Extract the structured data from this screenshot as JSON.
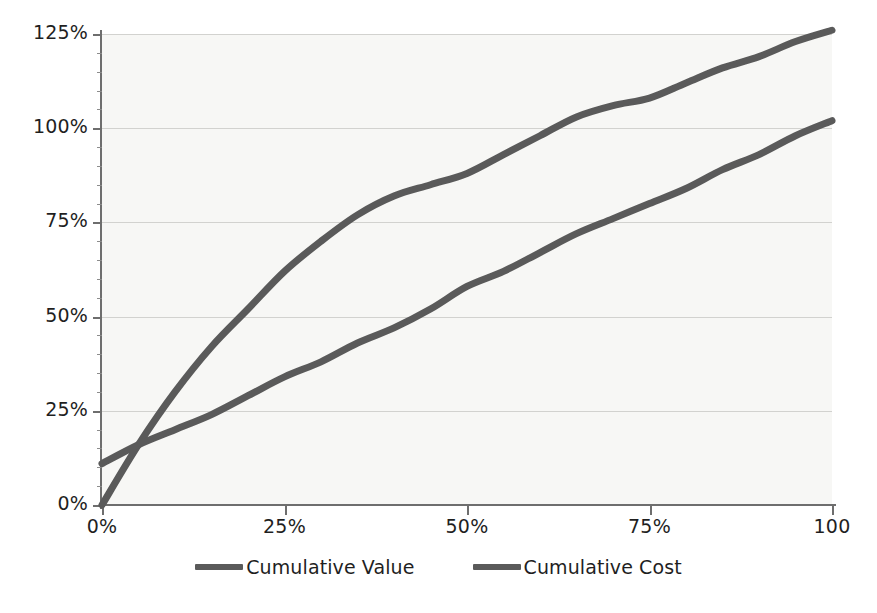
{
  "chart_data": {
    "type": "line",
    "title": "",
    "subtitle": "",
    "xlabel": "",
    "ylabel": "",
    "grid": true,
    "legend_position": "bottom",
    "xlim": [
      0,
      100
    ],
    "ylim": [
      0,
      125
    ],
    "x_tick_labels": [
      "0%",
      "25%",
      "50%",
      "75%",
      "100"
    ],
    "x_tick_values": [
      0,
      25,
      50,
      75,
      100
    ],
    "y_tick_labels": [
      "0%",
      "25%",
      "50%",
      "75%",
      "100%",
      "125%"
    ],
    "y_tick_values": [
      0,
      25,
      50,
      75,
      100,
      125
    ],
    "x": [
      0,
      5,
      10,
      15,
      20,
      25,
      30,
      35,
      40,
      45,
      50,
      55,
      60,
      65,
      70,
      75,
      80,
      85,
      90,
      95,
      100
    ],
    "series": [
      {
        "name": "Cumulative Value",
        "color": "#5a5a5a",
        "values": [
          0,
          16,
          30,
          42,
          52,
          62,
          70,
          77,
          82,
          85,
          88,
          93,
          98,
          103,
          106,
          108,
          112,
          116,
          119,
          123,
          126
        ]
      },
      {
        "name": "Cumulative Cost",
        "color": "#5a5a5a",
        "values": [
          11,
          16,
          20,
          24,
          29,
          34,
          38,
          43,
          47,
          52,
          58,
          62,
          67,
          72,
          76,
          80,
          84,
          89,
          93,
          98,
          102
        ]
      }
    ]
  },
  "axes": {
    "y_labels": [
      {
        "text": "125%",
        "value": 125
      },
      {
        "text": "100%",
        "value": 100
      },
      {
        "text": "75%",
        "value": 75
      },
      {
        "text": "50%",
        "value": 50
      },
      {
        "text": "25%",
        "value": 25
      },
      {
        "text": "0%",
        "value": 0
      }
    ],
    "x_labels": [
      {
        "text": "0%",
        "value": 0
      },
      {
        "text": "25%",
        "value": 25
      },
      {
        "text": "50%",
        "value": 50
      },
      {
        "text": "75%",
        "value": 75
      },
      {
        "text": "100",
        "value": 100
      }
    ]
  },
  "legend": {
    "items": [
      {
        "label": "Cumulative Value",
        "color": "#5a5a5a"
      },
      {
        "label": "Cumulative Cost",
        "color": "#5a5a5a"
      }
    ]
  },
  "colors": {
    "plot_background": "#f7f7f5",
    "gridline": "#d2d2cf",
    "axis": "#6e6e6e",
    "series_value": "#5a5a5a",
    "series_cost": "#5a5a5a",
    "text": "#1f1f1f"
  }
}
